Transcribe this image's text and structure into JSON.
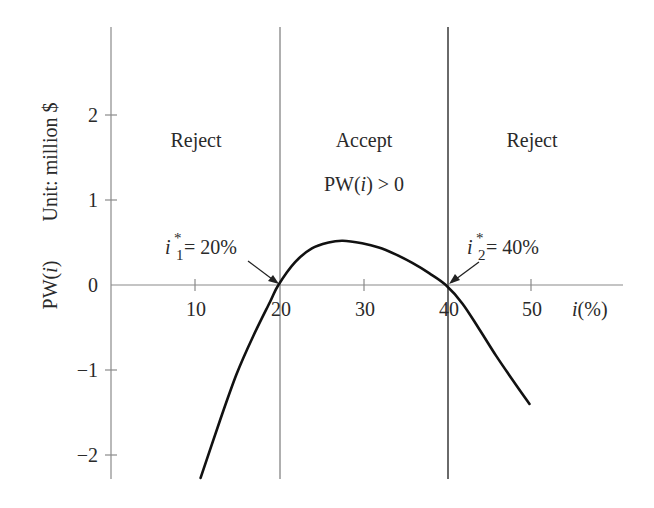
{
  "chart_data": {
    "type": "line",
    "title": "",
    "xlabel": "i(%)",
    "ylabel": "PW(i)",
    "unit_label": "Unit: million $",
    "xlim": [
      0,
      56
    ],
    "ylim": [
      -2.3,
      3.0
    ],
    "grid": false,
    "x_ticks": [
      10,
      20,
      30,
      40,
      50
    ],
    "x_tick_labels": [
      "10",
      "20",
      "30",
      "40",
      "50"
    ],
    "y_ticks": [
      2,
      1,
      0,
      -1,
      -2
    ],
    "y_tick_labels": [
      "2",
      "1",
      "0",
      "−1",
      "−2"
    ],
    "series": [
      {
        "name": "PW(i)",
        "x": [
          10.7,
          13,
          15,
          17,
          19,
          20,
          22,
          24,
          26,
          27.7,
          30,
          32,
          34,
          36,
          38,
          40,
          42,
          44,
          46,
          48,
          50
        ],
        "values": [
          -2.27,
          -1.6,
          -1.05,
          -0.6,
          -0.2,
          0.0,
          0.27,
          0.43,
          0.5,
          0.52,
          0.49,
          0.44,
          0.36,
          0.26,
          0.14,
          0.0,
          -0.22,
          -0.52,
          -0.83,
          -1.12,
          -1.4
        ]
      }
    ],
    "vertical_lines": [
      20,
      40
    ],
    "regions": [
      {
        "label": "Reject",
        "x_range": [
          0,
          20
        ]
      },
      {
        "label": "Accept",
        "sublabel": "PW(i) > 0",
        "x_range": [
          20,
          40
        ]
      },
      {
        "label": "Reject",
        "x_range": [
          40,
          56
        ]
      }
    ],
    "annotations": [
      {
        "text": "i*1 = 20%",
        "base": "i",
        "sup": "*",
        "sub": "1",
        "rest": " = 20%",
        "x": 20,
        "y": 0
      },
      {
        "text": "i*2 = 40%",
        "base": "i",
        "sup": "*",
        "sub": "2",
        "rest": " = 40%",
        "x": 40,
        "y": 0
      }
    ]
  },
  "labels": {
    "ylabel_main": "PW(",
    "ylabel_var": "i",
    "ylabel_close": ")",
    "unit": "Unit: million $",
    "xlabel_var": "i",
    "xlabel_rest": "(%)",
    "region_left": "Reject",
    "region_middle": "Accept",
    "region_middle_sub_pre": "PW(",
    "region_middle_sub_var": "i",
    "region_middle_sub_post": ") > 0",
    "region_right": "Reject",
    "root1_base": "i",
    "root1_sup": "*",
    "root1_sub": "1",
    "root1_rest": " = 20%",
    "root2_base": "i",
    "root2_sup": "*",
    "root2_sub": "2",
    "root2_rest": " = 40%",
    "xtick_10": "10",
    "xtick_20": "20",
    "xtick_30": "30",
    "xtick_40": "40",
    "xtick_50": "50",
    "ytick_2": "2",
    "ytick_1": "1",
    "ytick_0": "0",
    "ytick_m1": "−1",
    "ytick_m2": "−2"
  }
}
